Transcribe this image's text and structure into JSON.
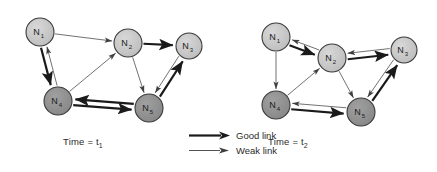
{
  "figure": {
    "background": "#ffffff",
    "node_fill_light": "#c6c6c6",
    "node_fill_dark": "#8f8f8f",
    "node_stroke": "#3a3a3a",
    "good_link_color": "#1a1a1a",
    "weak_link_color": "#4d4d4d",
    "good_link_width": 2.2,
    "weak_link_width": 0.8
  },
  "legend": {
    "items": [
      {
        "label": "Good link",
        "kind": "good"
      },
      {
        "label": "Weak link",
        "kind": "weak"
      }
    ]
  },
  "panels": [
    {
      "id": "panel-t1",
      "caption_prefix": "Time = t",
      "caption_sub": "1",
      "caption_full": "Time = t1",
      "nodes": [
        {
          "id": "N1",
          "label": "N",
          "sub": "1",
          "x": 40,
          "y": 32,
          "r": 14,
          "shade": "light"
        },
        {
          "id": "N2",
          "label": "N",
          "sub": "2",
          "x": 128,
          "y": 43,
          "r": 14,
          "shade": "light"
        },
        {
          "id": "N3",
          "label": "N",
          "sub": "3",
          "x": 189,
          "y": 46,
          "r": 13,
          "shade": "light"
        },
        {
          "id": "N4",
          "label": "N",
          "sub": "4",
          "x": 58,
          "y": 101,
          "r": 14,
          "shade": "dark"
        },
        {
          "id": "N5",
          "label": "N",
          "sub": "5",
          "x": 149,
          "y": 108,
          "r": 14,
          "shade": "dark"
        }
      ],
      "edges": [
        {
          "from": "N1",
          "to": "N2",
          "kind": "weak",
          "offset": 0
        },
        {
          "from": "N1",
          "to": "N4",
          "kind": "good",
          "offset": 3
        },
        {
          "from": "N4",
          "to": "N1",
          "kind": "weak",
          "offset": 3
        },
        {
          "from": "N4",
          "to": "N2",
          "kind": "weak",
          "offset": 0
        },
        {
          "from": "N2",
          "to": "N3",
          "kind": "good",
          "offset": 0
        },
        {
          "from": "N2",
          "to": "N5",
          "kind": "weak",
          "offset": 0
        },
        {
          "from": "N3",
          "to": "N5",
          "kind": "weak",
          "offset": 3
        },
        {
          "from": "N5",
          "to": "N3",
          "kind": "good",
          "offset": 3
        },
        {
          "from": "N5",
          "to": "N4",
          "kind": "good",
          "offset": 3
        },
        {
          "from": "N4",
          "to": "N5",
          "kind": "good",
          "offset": 3
        }
      ]
    },
    {
      "id": "panel-t2",
      "caption_prefix": "Time = t",
      "caption_sub": "2",
      "caption_full": "Time = t2",
      "nodes": [
        {
          "id": "N1",
          "label": "N",
          "sub": "1",
          "x": 276,
          "y": 37,
          "r": 14,
          "shade": "light"
        },
        {
          "id": "N2",
          "label": "N",
          "sub": "2",
          "x": 332,
          "y": 58,
          "r": 14,
          "shade": "light"
        },
        {
          "id": "N3",
          "label": "N",
          "sub": "3",
          "x": 404,
          "y": 50,
          "r": 13,
          "shade": "light"
        },
        {
          "id": "N4",
          "label": "N",
          "sub": "4",
          "x": 276,
          "y": 105,
          "r": 14,
          "shade": "dark"
        },
        {
          "id": "N5",
          "label": "N",
          "sub": "5",
          "x": 361,
          "y": 112,
          "r": 14,
          "shade": "dark"
        }
      ],
      "edges": [
        {
          "from": "N1",
          "to": "N2",
          "kind": "good",
          "offset": 3
        },
        {
          "from": "N2",
          "to": "N1",
          "kind": "weak",
          "offset": 3
        },
        {
          "from": "N1",
          "to": "N4",
          "kind": "weak",
          "offset": 0
        },
        {
          "from": "N2",
          "to": "N3",
          "kind": "good",
          "offset": 3
        },
        {
          "from": "N3",
          "to": "N2",
          "kind": "weak",
          "offset": 3
        },
        {
          "from": "N4",
          "to": "N2",
          "kind": "weak",
          "offset": 0
        },
        {
          "from": "N2",
          "to": "N5",
          "kind": "weak",
          "offset": 0
        },
        {
          "from": "N3",
          "to": "N5",
          "kind": "weak",
          "offset": 3
        },
        {
          "from": "N5",
          "to": "N3",
          "kind": "good",
          "offset": 3
        },
        {
          "from": "N5",
          "to": "N4",
          "kind": "weak",
          "offset": 3
        },
        {
          "from": "N4",
          "to": "N5",
          "kind": "good",
          "offset": 3
        }
      ]
    }
  ],
  "captions": {
    "t1": {
      "left": 63,
      "top": 136
    },
    "t2": {
      "left": 268,
      "top": 136
    }
  },
  "chart_data": {
    "type": "diagram"
  }
}
